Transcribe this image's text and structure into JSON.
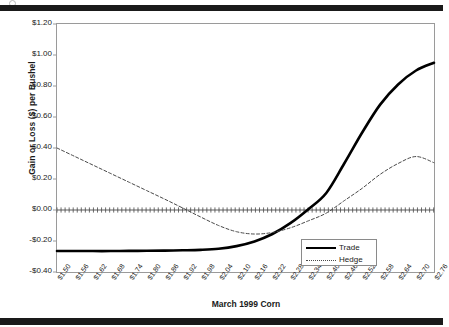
{
  "document": {
    "page_marks": {
      "top_bar": "scan-bar",
      "bottom_bar": "scan-bar"
    }
  },
  "chart_data": {
    "type": "line",
    "title": "",
    "xlabel": "March 1999 Corn",
    "ylabel": "Gain or Loss ($) per Bushel",
    "grid": false,
    "legend_position": "inside-right-lower",
    "ylim": [
      -0.4,
      1.2
    ],
    "ytick_labels": [
      "$1.20",
      "$1.00",
      "$0.80",
      "$0.60",
      "$0.40",
      "$0.20",
      "$0.00",
      "-$0.20",
      "-$0.40"
    ],
    "ytick_values": [
      1.2,
      1.0,
      0.8,
      0.6,
      0.4,
      0.2,
      0.0,
      -0.2,
      -0.4
    ],
    "categories": [
      "$1.50",
      "$1.56",
      "$1.62",
      "$1.68",
      "$1.74",
      "$1.80",
      "$1.86",
      "$1.92",
      "$1.98",
      "$2.04",
      "$2.10",
      "$2.16",
      "$2.22",
      "$2.28",
      "$2.34",
      "$2.40",
      "$2.46",
      "$2.52",
      "$2.58",
      "$2.64",
      "$2.70",
      "$2.76"
    ],
    "x": [
      1.5,
      1.56,
      1.62,
      1.68,
      1.74,
      1.8,
      1.86,
      1.92,
      1.98,
      2.04,
      2.1,
      2.16,
      2.22,
      2.28,
      2.34,
      2.4,
      2.46,
      2.52,
      2.58,
      2.64,
      2.7,
      2.76
    ],
    "series": [
      {
        "name": "Trade",
        "style": "solid",
        "color": "#000000",
        "width": 2.6,
        "values": [
          -0.265,
          -0.265,
          -0.265,
          -0.265,
          -0.264,
          -0.263,
          -0.262,
          -0.26,
          -0.257,
          -0.25,
          -0.233,
          -0.203,
          -0.155,
          -0.085,
          0.005,
          0.11,
          0.3,
          0.5,
          0.68,
          0.81,
          0.9,
          0.95
        ]
      },
      {
        "name": "Hedge",
        "style": "dotted",
        "color": "#4a4a4a",
        "width": 1.0,
        "values": [
          0.4,
          0.345,
          0.29,
          0.235,
          0.18,
          0.125,
          0.07,
          0.013,
          -0.045,
          -0.1,
          -0.14,
          -0.155,
          -0.145,
          -0.115,
          -0.07,
          -0.02,
          0.06,
          0.14,
          0.23,
          0.3,
          0.345,
          0.305
        ]
      }
    ],
    "zero_line": {
      "value": 0.0,
      "style": "tick-dashed",
      "color": "#4a4a4a"
    }
  },
  "legend": {
    "entries": [
      {
        "label": "Trade",
        "style": "solid"
      },
      {
        "label": "Hedge",
        "style": "dotted"
      }
    ]
  }
}
